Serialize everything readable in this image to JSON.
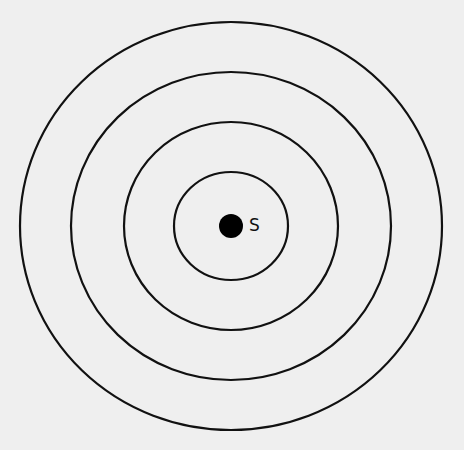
{
  "diagram": {
    "background": "#efefef",
    "stroke_color": "#111111",
    "source": {
      "label": "S",
      "cx": 231,
      "cy": 226,
      "r": 12
    },
    "rings": [
      {
        "rx": 57,
        "ry": 54
      },
      {
        "rx": 107,
        "ry": 104
      },
      {
        "rx": 160,
        "ry": 154
      },
      {
        "rx": 211,
        "ry": 204
      }
    ]
  }
}
